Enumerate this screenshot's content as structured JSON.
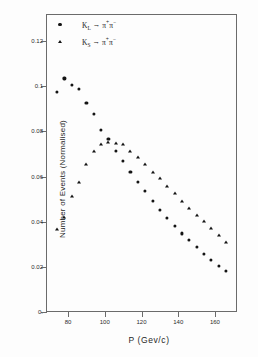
{
  "chart_data": {
    "type": "scatter",
    "title": "",
    "xlabel": "P  (Gev/c)",
    "ylabel": "Number of Events (Normalised)",
    "xlim": [
      68,
      172
    ],
    "ylim": [
      0,
      0.132
    ],
    "xticks": [
      80,
      100,
      120,
      140,
      160
    ],
    "yticks": [
      0,
      0.02,
      0.04,
      0.06,
      0.08,
      0.1,
      0.12
    ],
    "ytick_labels": [
      "0.",
      "0.02",
      "0.04",
      "0.06",
      "0.08",
      "0.1",
      "0.12"
    ],
    "xtick_labels": [
      "80",
      "100",
      "120",
      "140",
      "160"
    ],
    "grid": false,
    "legend_position": "top-left",
    "series": [
      {
        "name": "K_L -> pi+ pi-",
        "marker": "circle",
        "color": "#141414",
        "x": [
          74,
          78,
          82,
          86,
          90,
          94,
          98,
          102,
          106,
          110,
          114,
          118,
          122,
          126,
          130,
          134,
          138,
          142,
          146,
          150,
          154,
          158,
          162,
          166
        ],
        "y": [
          0.0975,
          0.1035,
          0.1005,
          0.0988,
          0.0925,
          0.0878,
          0.0805,
          0.0765,
          0.0712,
          0.0668,
          0.0622,
          0.0578,
          0.0535,
          0.0492,
          0.0452,
          0.0418,
          0.0382,
          0.0348,
          0.0318,
          0.0288,
          0.0258,
          0.0232,
          0.0205,
          0.0182
        ]
      },
      {
        "name": "K_S -> pi+ pi-",
        "marker": "triangle",
        "color": "#141414",
        "x": [
          74,
          78,
          82,
          86,
          90,
          94,
          98,
          102,
          106,
          110,
          114,
          118,
          122,
          126,
          130,
          134,
          138,
          142,
          146,
          150,
          154,
          158,
          162,
          166
        ],
        "y": [
          0.0368,
          0.0422,
          0.0512,
          0.0578,
          0.0655,
          0.0712,
          0.0745,
          0.0755,
          0.0748,
          0.0742,
          0.0712,
          0.0688,
          0.0655,
          0.0622,
          0.0592,
          0.0558,
          0.0528,
          0.0492,
          0.0462,
          0.0428,
          0.0402,
          0.0372,
          0.0342,
          0.0308
        ]
      }
    ]
  },
  "legend": {
    "entries": [
      {
        "marker": "circle",
        "particle": "K",
        "sub": "L",
        "arrow": "→",
        "product1": "π",
        "sup1": "+",
        "product2": "π",
        "sup2": "−"
      },
      {
        "marker": "triangle",
        "particle": "K",
        "sub": "S",
        "arrow": "→",
        "product1": "π",
        "sup1": "+",
        "product2": "π",
        "sup2": "−"
      }
    ]
  }
}
